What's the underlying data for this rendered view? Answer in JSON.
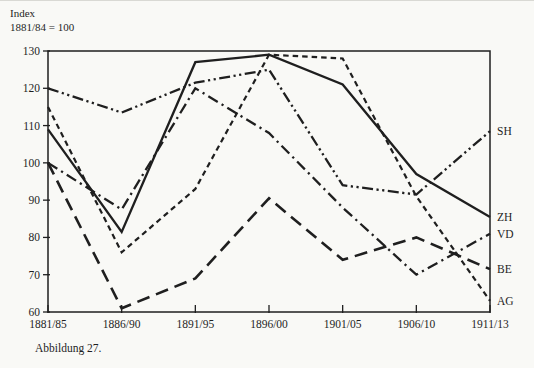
{
  "header": {
    "line1": "Index",
    "line2": "1881/84 = 100"
  },
  "caption": "Abbildung 27.",
  "colors": {
    "ink": "#1f1f1f",
    "paper": "#f9f9f6"
  },
  "chart_data": {
    "type": "line",
    "title": "",
    "xlabel": "",
    "ylabel": "Index 1881/84 = 100",
    "categories": [
      "1881/85",
      "1886/90",
      "1891/95",
      "1896/00",
      "1901/05",
      "1906/10",
      "1911/13"
    ],
    "series": [
      {
        "name": "SH",
        "dash": "dash-dot-dot",
        "values": [
          120,
          113.5,
          121.5,
          125,
          94,
          91.5,
          108.5
        ]
      },
      {
        "name": "ZH",
        "dash": "solid",
        "values": [
          109,
          81.5,
          127,
          129,
          121,
          97,
          85.5
        ]
      },
      {
        "name": "VD",
        "dash": "dash-dot",
        "values": [
          100,
          87.5,
          120,
          108,
          88,
          70,
          81
        ]
      },
      {
        "name": "BE",
        "dash": "long-dash",
        "values": [
          100,
          61,
          69,
          90.5,
          74,
          80,
          71.5
        ]
      },
      {
        "name": "AG",
        "dash": "short-dash",
        "values": [
          115,
          76,
          93,
          129,
          128,
          91,
          63
        ]
      }
    ],
    "ylim": [
      60,
      130
    ],
    "yticks": [
      60,
      70,
      80,
      90,
      100,
      110,
      120,
      130
    ],
    "grid": false,
    "legend_position": "right-edge-labels"
  }
}
